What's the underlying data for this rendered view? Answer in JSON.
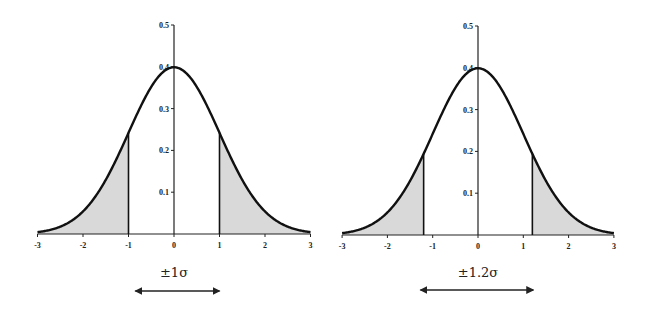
{
  "chart_data": [
    {
      "type": "area",
      "title": "",
      "description": "Standard normal density with tails beyond ±1σ shaded",
      "xlabel": "",
      "ylabel": "",
      "xlim": [
        -3,
        3
      ],
      "ylim": [
        0,
        0.5
      ],
      "x_ticks": [
        -3,
        -2,
        -1,
        0,
        1,
        2,
        3
      ],
      "x_tick_labels": [
        "-3",
        "-2",
        "-1",
        "0",
        "1",
        "2",
        "3"
      ],
      "y_ticks": [
        0.1,
        0.2,
        0.3,
        0.4,
        0.5
      ],
      "y_tick_labels": [
        "0.1",
        "0.2",
        "0.3",
        "0.4",
        "0.5"
      ],
      "grid": false,
      "series": [
        {
          "name": "normal pdf",
          "function": "0.3989*exp(-x^2/2)",
          "x": [
            -3,
            -2.5,
            -2,
            -1.5,
            -1,
            -0.5,
            0,
            0.5,
            1,
            1.5,
            2,
            2.5,
            3
          ],
          "values": [
            0.004,
            0.018,
            0.054,
            0.13,
            0.242,
            0.352,
            0.399,
            0.352,
            0.242,
            0.13,
            0.054,
            0.018,
            0.004
          ]
        }
      ],
      "cutoff": 1,
      "shaded_regions": [
        [
          -3,
          -1
        ],
        [
          1,
          3
        ]
      ],
      "fill_color": "#d9d9d9",
      "annotation": "±1σ",
      "arrow_range": [
        -0.85,
        1.0
      ]
    },
    {
      "type": "area",
      "title": "",
      "description": "Standard normal density with tails beyond ±1.2σ shaded",
      "xlabel": "",
      "ylabel": "",
      "xlim": [
        -3,
        3
      ],
      "ylim": [
        0,
        0.5
      ],
      "x_ticks": [
        -3,
        -2,
        -1,
        0,
        1,
        2,
        3
      ],
      "x_tick_labels": [
        "-3",
        "-2",
        "-1",
        "0",
        "1",
        "2",
        "3"
      ],
      "y_ticks": [
        0.1,
        0.2,
        0.3,
        0.4,
        0.5
      ],
      "y_tick_labels": [
        "0.1",
        "0.2",
        "0.3",
        "0.4",
        "0.5"
      ],
      "grid": false,
      "series": [
        {
          "name": "normal pdf",
          "function": "0.3989*exp(-x^2/2)",
          "x": [
            -3,
            -2.5,
            -2,
            -1.5,
            -1.2,
            -1,
            -0.5,
            0,
            0.5,
            1,
            1.2,
            1.5,
            2,
            2.5,
            3
          ],
          "values": [
            0.004,
            0.018,
            0.054,
            0.13,
            0.194,
            0.242,
            0.352,
            0.399,
            0.352,
            0.242,
            0.194,
            0.13,
            0.054,
            0.018,
            0.004
          ]
        }
      ],
      "cutoff": 1.2,
      "shaded_regions": [
        [
          -3,
          -1.2
        ],
        [
          1.2,
          3
        ]
      ],
      "fill_color": "#d9d9d9",
      "annotation": "±1.2σ",
      "arrow_range": [
        -1.27,
        1.22
      ]
    }
  ],
  "panels": [
    {
      "origin_x": 174,
      "baseline_y": 234,
      "px_per_unit": 45.5,
      "px_per_density": 418,
      "label_y": 277,
      "arrow_y": 291
    },
    {
      "origin_x": 478,
      "baseline_y": 235,
      "px_per_unit": 45.3,
      "px_per_density": 418,
      "label_y": 277,
      "arrow_y": 290
    }
  ],
  "labels": {
    "left_annotation": "±1σ",
    "right_annotation": "±1.2σ"
  }
}
